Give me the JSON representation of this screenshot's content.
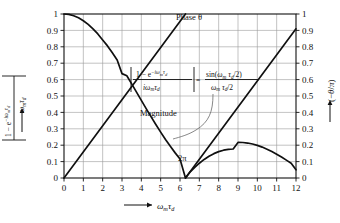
{
  "chart_data": {
    "type": "line",
    "title": "",
    "xlabel": "ωₘτ_d",
    "ylabel_left": "|1 − e^(−iωₘτ_d)| / ωₘτ_d",
    "ylabel_right": "(−θ/π)",
    "xlim": [
      0,
      12
    ],
    "ylim": [
      0,
      1
    ],
    "grid": true,
    "legend": "inline-annotations",
    "xticks": [
      "0",
      "1",
      "2",
      "3",
      "4",
      "5",
      "6",
      "7",
      "8",
      "9",
      "10",
      "11",
      "12"
    ],
    "yticks": [
      "0",
      "0.1",
      "0.2",
      "0.3",
      "0.4",
      "0.5",
      "0.6",
      "0.7",
      "0.8",
      "0.9",
      "1"
    ],
    "series": [
      {
        "name": "Magnitude",
        "formula": "|sin(x/2)/(x/2)|",
        "x": [
          0,
          0.25,
          0.5,
          0.75,
          1,
          1.25,
          1.5,
          1.75,
          2,
          2.25,
          2.5,
          2.75,
          3,
          3.25,
          3.5,
          3.75,
          4,
          4.25,
          4.5,
          4.75,
          5,
          5.25,
          5.5,
          5.75,
          6,
          6.2832,
          6.5,
          6.75,
          7,
          7.25,
          7.5,
          7.75,
          8,
          8.25,
          8.5,
          8.75,
          9,
          9.25,
          9.5,
          9.75,
          10,
          10.25,
          10.5,
          10.75,
          11,
          11.25,
          11.5,
          11.75,
          12
        ],
        "y": [
          1,
          0.9974,
          0.9896,
          0.9767,
          0.9589,
          0.9364,
          0.9094,
          0.8784,
          0.8415,
          0.8054,
          0.7635,
          0.7191,
          0.6366,
          0.6237,
          0.5741,
          0.5239,
          0.4735,
          0.4234,
          0.3742,
          0.3262,
          0.2797,
          0.2352,
          0.1929,
          0.1532,
          0.116,
          0.0,
          0.0337,
          0.0634,
          0.09,
          0.1131,
          0.1326,
          0.1485,
          0.1608,
          0.1695,
          0.1748,
          0.1768,
          0.217,
          0.2164,
          0.2132,
          0.2074,
          0.1991,
          0.1885,
          0.1758,
          0.1612,
          0.145,
          0.1275,
          0.1089,
          0.0897,
          0.0501
        ]
      },
      {
        "name": "Phase θ",
        "formula": "(−θ/π) sawtooth, slope 1/(2π)",
        "x": [
          0,
          6.2832,
          6.2832,
          12
        ],
        "y": [
          0,
          1,
          0,
          0.9094
        ]
      }
    ],
    "annotations": [
      {
        "name": "phase-label",
        "text": "Phase θ",
        "x": 4.55,
        "y": 0.955
      },
      {
        "name": "magnitude-label",
        "text": "Magnitude",
        "x": 3.95,
        "y": 0.37
      },
      {
        "name": "two-pi-label",
        "text": "2π",
        "x": 6.2,
        "y": 0.105
      }
    ],
    "equation": {
      "lhs_num": "1 − e",
      "lhs_num_exp": "−iωₘτ_d",
      "lhs_den": "iωₘτ_d",
      "equals": "=",
      "rhs_num": "sin(ωₘ τ_d /2)",
      "rhs_den": "ωₘ τ_d /2"
    }
  },
  "axes": {
    "x": {
      "ticks": [
        "0",
        "1",
        "2",
        "3",
        "4",
        "5",
        "6",
        "7",
        "8",
        "9",
        "10",
        "11",
        "12"
      ],
      "title_omega": "ω",
      "title_sub_m": "m",
      "title_tau": "τ",
      "title_sub_d": "d"
    },
    "y_left": {
      "ticks": [
        "1",
        "0.9",
        "0.8",
        "0.7",
        "0.6",
        "0.5",
        "0.4",
        "0.3",
        "0.2",
        "0.1",
        "0"
      ],
      "numerator": "1 − e",
      "numerator_exp": "−iω",
      "numerator_exp_sub": "m",
      "numerator_exp_tau": "τ",
      "numerator_exp_tau_sub": "d",
      "denominator_omega": "ω",
      "denominator_sub_m": "m",
      "denominator_tau": "τ",
      "denominator_sub_d": "d"
    },
    "y_right": {
      "ticks": [
        "1",
        "0.9",
        "0.8",
        "0.7",
        "0.6",
        "0.5",
        "0.4",
        "0.3",
        "0.2",
        "0.1",
        "0"
      ],
      "label_open": "(",
      "label_minus": "−",
      "label_theta": "θ",
      "label_slash": "/",
      "label_pi": "π",
      "label_close": ")"
    }
  },
  "colors": {
    "curve": "#101010",
    "grid": "#9a9a9a",
    "frame": "#111111",
    "text": "#111111",
    "background": "#ffffff",
    "leader": "#555555"
  }
}
